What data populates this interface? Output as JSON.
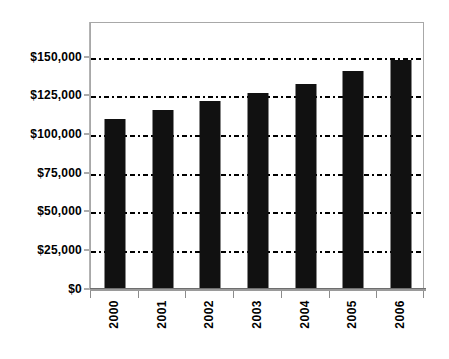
{
  "chart_data": {
    "type": "bar",
    "title": "",
    "subtitle": "",
    "xlabel": "",
    "ylabel": "",
    "categories": [
      "2000",
      "2001",
      "2002",
      "2003",
      "2004",
      "2005",
      "2006"
    ],
    "values": [
      111000,
      117000,
      123000,
      128000,
      134000,
      142000,
      149000
    ],
    "series": [
      {
        "name": "",
        "values": [
          111000,
          117000,
          123000,
          128000,
          134000,
          142000,
          149000
        ]
      }
    ],
    "ylim": [
      0,
      160000
    ],
    "y_tick_values": [
      0,
      25000,
      50000,
      75000,
      100000,
      125000,
      150000
    ],
    "y_tick_labels": [
      "$0",
      "$25,000",
      "$50,000",
      "$75,000",
      "$100,000",
      "$125,000",
      "$150,000"
    ],
    "x_tick_labels": [
      "2000",
      "2001",
      "2002",
      "2003",
      "2004",
      "2005",
      "2006"
    ],
    "x_tick_label_rotation": 90,
    "grid": true,
    "grid_axis": "y",
    "grid_style": "dash-dot",
    "legend": false,
    "legend_position": "none",
    "bar_color": "#111111",
    "gridline_color": "#000000",
    "frame_color": "#a8a8a8",
    "background_color": "#ffffff",
    "annotations": []
  }
}
